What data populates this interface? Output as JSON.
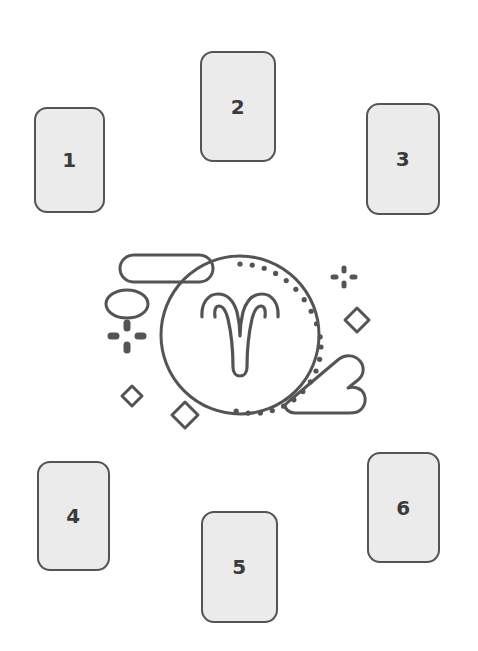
{
  "canvas": {
    "width": 478,
    "height": 651,
    "background_color": "#ffffff"
  },
  "palette": {
    "card_fill": "#ebebeb",
    "card_stroke": "#545454",
    "number_color": "#3b3b3b",
    "illustration_stroke": "#545454"
  },
  "spread": {
    "name": "six-card-spread",
    "card_count": 6,
    "cards": [
      {
        "id": "card-1",
        "label": "1",
        "position": "top-left"
      },
      {
        "id": "card-2",
        "label": "2",
        "position": "top-center"
      },
      {
        "id": "card-3",
        "label": "3",
        "position": "top-right"
      },
      {
        "id": "card-4",
        "label": "4",
        "position": "bottom-left"
      },
      {
        "id": "card-5",
        "label": "5",
        "position": "bottom-center"
      },
      {
        "id": "card-6",
        "label": "6",
        "position": "bottom-right"
      }
    ]
  },
  "illustration": {
    "name": "aries-zodiac-illustration",
    "zodiac_sign": "Aries",
    "glyph": "ram-horns",
    "elements": [
      {
        "name": "main-circle",
        "type": "circle-outline"
      },
      {
        "name": "dotted-inner-ring",
        "type": "dotted-arc"
      },
      {
        "name": "aries-glyph",
        "type": "double-outline-glyph"
      },
      {
        "name": "cloud-top-left",
        "type": "pill-outline"
      },
      {
        "name": "cloud-bottom-right",
        "type": "cloud-outline"
      },
      {
        "name": "ellipse-left",
        "type": "ellipse-outline"
      },
      {
        "name": "sparkle-left",
        "type": "four-dash-sparkle"
      },
      {
        "name": "sparkle-top-right",
        "type": "four-dash-sparkle"
      },
      {
        "name": "diamond-right",
        "type": "diamond-outline"
      },
      {
        "name": "diamond-bottom-left-small",
        "type": "diamond-outline"
      },
      {
        "name": "diamond-bottom-left-large",
        "type": "diamond-outline"
      }
    ]
  }
}
